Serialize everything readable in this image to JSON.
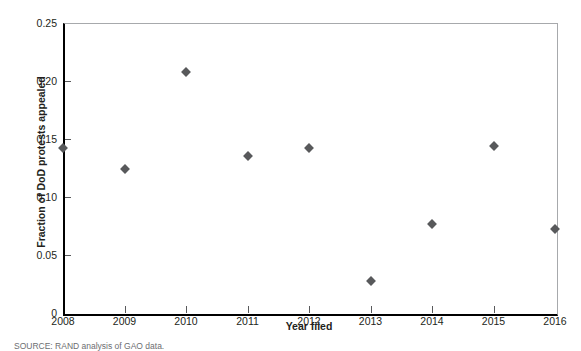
{
  "chart_data": {
    "type": "scatter",
    "title": "",
    "xlabel": "Year filed",
    "ylabel": "Fraction of DoD protests appealed",
    "x": [
      2008,
      2009,
      2010,
      2011,
      2012,
      2013,
      2014,
      2015,
      2016
    ],
    "values": [
      0.142,
      0.124,
      0.208,
      0.135,
      0.142,
      0.028,
      0.077,
      0.144,
      0.072
    ],
    "xlim": [
      2008,
      2016
    ],
    "ylim": [
      0,
      0.25
    ],
    "x_tick_labels": [
      "2008",
      "2009",
      "2010",
      "2011",
      "2012",
      "2013",
      "2014",
      "2015",
      "2016"
    ],
    "y_tick_labels": [
      "0",
      "0.05",
      "0.10",
      "0.15",
      "0.20",
      "0.25"
    ],
    "y_tick_values": [
      0,
      0.05,
      0.1,
      0.15,
      0.2,
      0.25
    ],
    "grid": false,
    "legend": false,
    "marker_shape": "diamond",
    "marker_color": "#58595b",
    "axis_color": "#000000",
    "frame_color": "#a7a9ac"
  },
  "figure": {
    "source_note": "SOURCE: RAND analysis of GAO data."
  }
}
